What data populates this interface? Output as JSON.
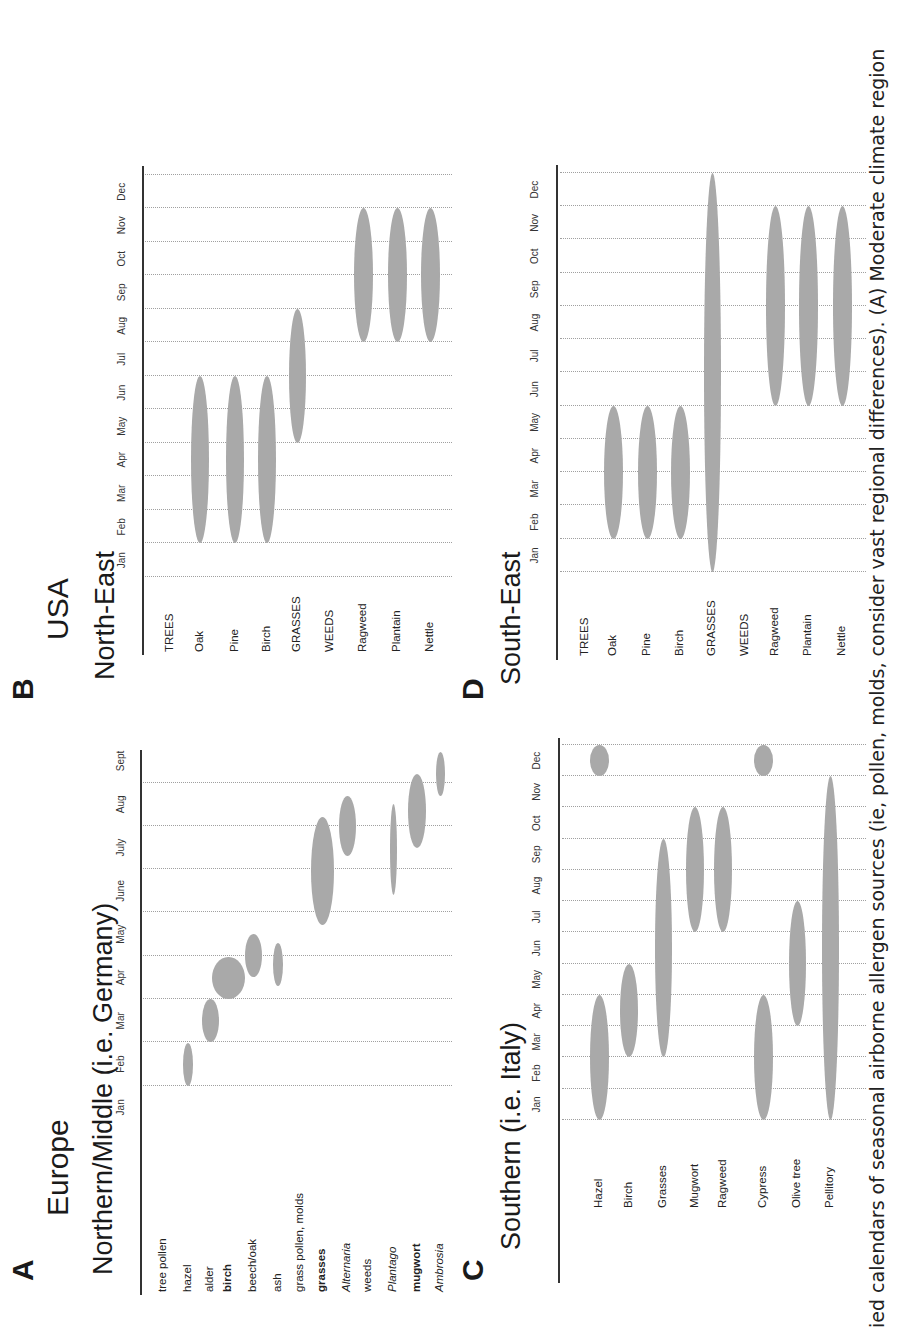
{
  "caption": "ied calendars of seasonal airborne allergen sources (ie, pollen, molds, consider vast regional differences). (A) Moderate climate region",
  "chart_data": [
    {
      "id": "A",
      "type": "bubble-calendar",
      "panel_letter": "A",
      "region": "Europe",
      "title": "Northern/Middle (i.e. Germany)",
      "months": [
        "Jan",
        "Feb",
        "Mar",
        "Apr",
        "May",
        "June",
        "July",
        "Aug",
        "Sept"
      ],
      "categories": [
        {
          "label": "tree pollen",
          "style": "normal",
          "header": true
        },
        {
          "label": "hazel",
          "style": "normal",
          "season": [
            1.0,
            1.98
          ],
          "width": 10
        },
        {
          "label": "alder",
          "style": "normal",
          "season": [
            2.0,
            3.0
          ],
          "width": 17
        },
        {
          "label": "birch",
          "style": "bold",
          "season": [
            3.0,
            3.98
          ],
          "width": 33
        },
        {
          "label": "beech/oak",
          "style": "normal",
          "season": [
            3.5,
            4.5
          ],
          "width": 17
        },
        {
          "label": "ash",
          "style": "normal",
          "season": [
            3.3,
            4.3
          ],
          "width": 10
        },
        {
          "label": "grass pollen, molds",
          "style": "normal",
          "header": true
        },
        {
          "label": "grasses",
          "style": "bold",
          "season": [
            4.7,
            7.2
          ],
          "width": 23
        },
        {
          "label": "Alternaria",
          "style": "italic",
          "season": [
            6.3,
            7.7
          ],
          "width": 17
        },
        {
          "label": "weeds",
          "style": "normal",
          "header": true
        },
        {
          "label": "Plantago",
          "style": "italic",
          "season": [
            5.4,
            7.5
          ],
          "width": 7
        },
        {
          "label": "mugwort",
          "style": "bold",
          "season": [
            6.5,
            8.2
          ],
          "width": 18
        },
        {
          "label": "Ambrosia",
          "style": "italic",
          "season": [
            7.7,
            8.7
          ],
          "width": 9
        }
      ]
    },
    {
      "id": "B",
      "type": "bubble-calendar",
      "panel_letter": "B",
      "region": "USA",
      "title": "North-East",
      "months": [
        "Jan",
        "Feb",
        "Mar",
        "Apr",
        "May",
        "Jun",
        "Jul",
        "Aug",
        "Sep",
        "Oct",
        "Nov",
        "Dec"
      ],
      "categories": [
        {
          "label": "TREES",
          "style": "normal",
          "header": true
        },
        {
          "label": "Oak",
          "style": "normal",
          "season": [
            1,
            6
          ],
          "width": 18
        },
        {
          "label": "Pine",
          "style": "normal",
          "season": [
            1,
            6
          ],
          "width": 18
        },
        {
          "label": "Birch",
          "style": "normal",
          "season": [
            1,
            6
          ],
          "width": 18
        },
        {
          "label": "GRASSES",
          "style": "normal",
          "season": [
            4,
            8
          ],
          "width": 17
        },
        {
          "label": "WEEDS",
          "style": "normal",
          "header": true
        },
        {
          "label": "Ragweed",
          "style": "normal",
          "season": [
            7,
            11
          ],
          "width": 19
        },
        {
          "label": "Plantain",
          "style": "normal",
          "season": [
            7,
            11
          ],
          "width": 19
        },
        {
          "label": "Nettle",
          "style": "normal",
          "season": [
            7,
            11
          ],
          "width": 19
        }
      ]
    },
    {
      "id": "C",
      "type": "bubble-calendar",
      "panel_letter": "C",
      "region": "",
      "title": "Southern (i.e. Italy)",
      "months": [
        "Jan",
        "Feb",
        "Mar",
        "Apr",
        "May",
        "Jun",
        "Jul",
        "Aug",
        "Sep",
        "Oct",
        "Nov",
        "Dec"
      ],
      "categories": [
        {
          "label": "Hazel",
          "style": "normal",
          "season": [
            0,
            4
          ],
          "width": 19,
          "extra": [
            11,
            12
          ]
        },
        {
          "label": "Birch",
          "style": "normal",
          "season": [
            2,
            5
          ],
          "width": 18
        },
        {
          "label": "Grasses",
          "style": "normal",
          "season": [
            2,
            9
          ],
          "width": 17
        },
        {
          "label": "Mugwort",
          "style": "normal",
          "season": [
            6,
            10
          ],
          "width": 18
        },
        {
          "label": "Ragweed",
          "style": "normal",
          "season": [
            6,
            10
          ],
          "width": 18
        },
        {
          "label": "Cypress",
          "style": "normal",
          "season": [
            0,
            4
          ],
          "width": 19,
          "extra": [
            11,
            12
          ]
        },
        {
          "label": "Olive tree",
          "style": "normal",
          "season": [
            3,
            7
          ],
          "width": 17
        },
        {
          "label": "Pellitory",
          "style": "normal",
          "season": [
            0,
            11
          ],
          "width": 17
        }
      ]
    },
    {
      "id": "D",
      "type": "bubble-calendar",
      "panel_letter": "D",
      "region": "",
      "title": "South-East",
      "months": [
        "Jan",
        "Feb",
        "Mar",
        "Apr",
        "May",
        "Jun",
        "Jul",
        "Aug",
        "Sep",
        "Oct",
        "Nov",
        "Dec"
      ],
      "categories": [
        {
          "label": "TREES",
          "style": "normal",
          "header": true
        },
        {
          "label": "Oak",
          "style": "normal",
          "season": [
            1,
            5
          ],
          "width": 19
        },
        {
          "label": "Pine",
          "style": "normal",
          "season": [
            1,
            5
          ],
          "width": 19
        },
        {
          "label": "Birch",
          "style": "normal",
          "season": [
            1,
            5
          ],
          "width": 19
        },
        {
          "label": "GRASSES",
          "style": "normal",
          "season": [
            0,
            12
          ],
          "width": 17
        },
        {
          "label": "WEEDS",
          "style": "normal",
          "header": true
        },
        {
          "label": "Ragweed",
          "style": "normal",
          "season": [
            5,
            11
          ],
          "width": 19
        },
        {
          "label": "Plantain",
          "style": "normal",
          "season": [
            5,
            11
          ],
          "width": 19
        },
        {
          "label": "Nettle",
          "style": "normal",
          "season": [
            5,
            11
          ],
          "width": 19
        }
      ]
    }
  ]
}
